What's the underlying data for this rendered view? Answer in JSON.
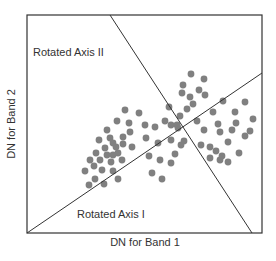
{
  "diagram": {
    "title": "",
    "x_axis_label": "DN for Band 1",
    "y_axis_label": "DN for Band 2",
    "rotated_axis_1_label": "Rotated Axis I",
    "rotated_axis_2_label": "Rotated Axis II",
    "colors": {
      "frame": "#333333",
      "axis_lines": "#333333",
      "points": "#808080",
      "text": "#333333"
    },
    "frame": {
      "x": 27,
      "y": 15,
      "width": 235,
      "height": 218
    },
    "rotated_axis_1": {
      "x1": 27,
      "y1": 233,
      "x2": 262,
      "y2": 73
    },
    "rotated_axis_2": {
      "x1": 110,
      "y1": 15,
      "x2": 252,
      "y2": 233
    },
    "points": [
      [
        125,
        110
      ],
      [
        139,
        113
      ],
      [
        117,
        121
      ],
      [
        129,
        123
      ],
      [
        107,
        130
      ],
      [
        130,
        132
      ],
      [
        110,
        138
      ],
      [
        123,
        137
      ],
      [
        99,
        140
      ],
      [
        113,
        143
      ],
      [
        123,
        144
      ],
      [
        132,
        147
      ],
      [
        105,
        148
      ],
      [
        116,
        147
      ],
      [
        96,
        153
      ],
      [
        107,
        155
      ],
      [
        118,
        153
      ],
      [
        100,
        160
      ],
      [
        90,
        160
      ],
      [
        111,
        162
      ],
      [
        122,
        160
      ],
      [
        94,
        166
      ],
      [
        102,
        170
      ],
      [
        113,
        171
      ],
      [
        85,
        171
      ],
      [
        95,
        179
      ],
      [
        89,
        185
      ],
      [
        104,
        184
      ],
      [
        113,
        155
      ],
      [
        118,
        179
      ],
      [
        145,
        125
      ],
      [
        155,
        127
      ],
      [
        165,
        121
      ],
      [
        177,
        125
      ],
      [
        146,
        138
      ],
      [
        158,
        143
      ],
      [
        171,
        140
      ],
      [
        181,
        145
      ],
      [
        149,
        156
      ],
      [
        160,
        160
      ],
      [
        171,
        163
      ],
      [
        152,
        173
      ],
      [
        162,
        179
      ],
      [
        175,
        154
      ],
      [
        184,
        141
      ],
      [
        191,
        74
      ],
      [
        204,
        79
      ],
      [
        183,
        85
      ],
      [
        199,
        90
      ],
      [
        182,
        93
      ],
      [
        190,
        97
      ],
      [
        205,
        95
      ],
      [
        193,
        104
      ],
      [
        187,
        109
      ],
      [
        169,
        107
      ],
      [
        180,
        116
      ],
      [
        197,
        121
      ],
      [
        213,
        112
      ],
      [
        223,
        101
      ],
      [
        171,
        125
      ],
      [
        178,
        128
      ],
      [
        218,
        124
      ],
      [
        235,
        112
      ],
      [
        245,
        102
      ],
      [
        236,
        123
      ],
      [
        253,
        119
      ],
      [
        204,
        130
      ],
      [
        220,
        132
      ],
      [
        232,
        130
      ],
      [
        210,
        147
      ],
      [
        216,
        151
      ],
      [
        222,
        156
      ],
      [
        210,
        158
      ],
      [
        228,
        142
      ],
      [
        245,
        136
      ],
      [
        250,
        131
      ],
      [
        220,
        160
      ],
      [
        201,
        145
      ],
      [
        239,
        153
      ],
      [
        228,
        162
      ]
    ]
  },
  "chart_data": {
    "type": "scatter",
    "title": "",
    "xlabel": "DN for Band 1",
    "ylabel": "DN for Band 2",
    "annotations": [
      "Rotated Axis I",
      "Rotated Axis II"
    ],
    "grid": false,
    "legend": "none"
  }
}
